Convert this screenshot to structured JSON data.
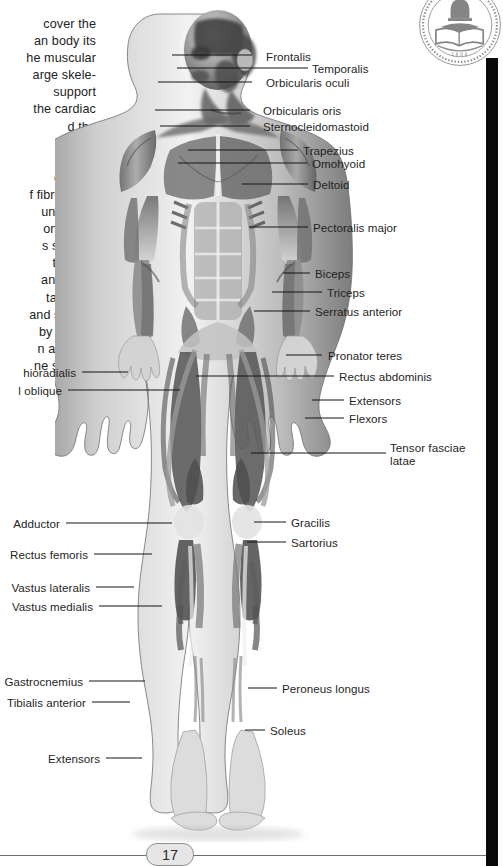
{
  "page": {
    "number": "17",
    "seal_icon": "book-and-bell-seal-icon",
    "seal_year": "1888"
  },
  "bodycopy": {
    "lines": [
      "cover the",
      "an body its",
      "he muscular",
      "arge skele-",
      " support",
      "the cardiac",
      "d the",
      "n our",
      "eletal",
      "ched to",
      "f fibrous tis-",
      " under our",
      "onding to",
      "s system,",
      "to allow",
      "and facial",
      "tary con-",
      "and smooth",
      "by signals",
      "n and hor-",
      "ne system."
    ]
  },
  "illustration": {
    "name": "anterior-view-human-muscular-system",
    "alt": "Front view of the human body showing superficial skeletal muscles"
  },
  "labels_right": [
    {
      "id": "frontalis",
      "text": "Frontalis",
      "x": 266,
      "y": 50,
      "lx1": 252,
      "ly1": 55,
      "lx2": 172,
      "ly2": 55
    },
    {
      "id": "temporalis",
      "text": "Temporalis",
      "x": 312,
      "y": 62,
      "lx1": 308,
      "ly1": 68,
      "lx2": 177,
      "ly2": 68
    },
    {
      "id": "orbicularis-oculi",
      "text": "Orbicularis oculi",
      "x": 266,
      "y": 76,
      "lx1": 252,
      "ly1": 82,
      "lx2": 158,
      "ly2": 82
    },
    {
      "id": "orbicularis-oris",
      "text": "Orbicularis oris",
      "x": 263,
      "y": 104,
      "lx1": 250,
      "ly1": 110,
      "lx2": 155,
      "ly2": 110
    },
    {
      "id": "sternocleidomastoid",
      "text": "Sternocleidomastoid",
      "x": 263,
      "y": 120,
      "lx1": 250,
      "ly1": 126,
      "lx2": 160,
      "ly2": 126
    },
    {
      "id": "trapezius",
      "text": "Trapezius",
      "x": 303,
      "y": 144,
      "lx1": 298,
      "ly1": 150,
      "lx2": 188,
      "ly2": 150
    },
    {
      "id": "omohyoid",
      "text": "Omohyoid",
      "x": 312,
      "y": 157,
      "lx1": 307,
      "ly1": 163,
      "lx2": 178,
      "ly2": 163
    },
    {
      "id": "deltoid",
      "text": "Deltoid",
      "x": 313,
      "y": 178,
      "lx1": 308,
      "ly1": 184,
      "lx2": 242,
      "ly2": 184
    },
    {
      "id": "pectoralis-major",
      "text": "Pectoralis major",
      "x": 313,
      "y": 221,
      "lx1": 308,
      "ly1": 227,
      "lx2": 249,
      "ly2": 227
    },
    {
      "id": "biceps",
      "text": "Biceps",
      "x": 315,
      "y": 267,
      "lx1": 310,
      "ly1": 273,
      "lx2": 283,
      "ly2": 273
    },
    {
      "id": "triceps",
      "text": "Triceps",
      "x": 327,
      "y": 286,
      "lx1": 322,
      "ly1": 292,
      "lx2": 272,
      "ly2": 292
    },
    {
      "id": "serratus-anterior",
      "text": "Serratus anterior",
      "x": 315,
      "y": 305,
      "lx1": 310,
      "ly1": 311,
      "lx2": 254,
      "ly2": 311
    },
    {
      "id": "pronator-teres",
      "text": "Pronator teres",
      "x": 328,
      "y": 349,
      "lx1": 322,
      "ly1": 355,
      "lx2": 286,
      "ly2": 355
    },
    {
      "id": "rectus-abdominis",
      "text": "Rectus abdominis",
      "x": 339,
      "y": 370,
      "lx1": 334,
      "ly1": 376,
      "lx2": 196,
      "ly2": 376
    },
    {
      "id": "extensors-arm",
      "text": "Extensors",
      "x": 349,
      "y": 394,
      "lx1": 344,
      "ly1": 400,
      "lx2": 312,
      "ly2": 400
    },
    {
      "id": "flexors-arm",
      "text": "Flexors",
      "x": 349,
      "y": 412,
      "lx1": 344,
      "ly1": 418,
      "lx2": 305,
      "ly2": 418
    },
    {
      "id": "tensor-fasciae-latae",
      "text": "Tensor\nfasciae latae",
      "x": 390,
      "y": 441,
      "lx1": 386,
      "ly1": 453,
      "lx2": 251,
      "ly2": 453
    },
    {
      "id": "gracilis",
      "text": "Gracilis",
      "x": 291,
      "y": 516,
      "lx1": 286,
      "ly1": 522,
      "lx2": 254,
      "ly2": 522
    },
    {
      "id": "sartorius",
      "text": "Sartorius",
      "x": 291,
      "y": 536,
      "lx1": 286,
      "ly1": 542,
      "lx2": 247,
      "ly2": 542
    },
    {
      "id": "peroneus-longus",
      "text": "Peroneus longus",
      "x": 282,
      "y": 682,
      "lx1": 277,
      "ly1": 688,
      "lx2": 248,
      "ly2": 688
    },
    {
      "id": "soleus",
      "text": "Soleus",
      "x": 270,
      "y": 724,
      "lx1": 265,
      "ly1": 730,
      "lx2": 245,
      "ly2": 730
    }
  ],
  "labels_left": [
    {
      "id": "brachioradialis",
      "text": "hioradialis",
      "x": 0,
      "y": 366,
      "lx1": 82,
      "ly1": 372,
      "lx2": 128,
      "ly2": 372,
      "w": 76
    },
    {
      "id": "external-oblique",
      "text": "l oblique",
      "x": 0,
      "y": 384,
      "lx1": 68,
      "ly1": 390,
      "lx2": 180,
      "ly2": 390,
      "w": 62
    },
    {
      "id": "adductor",
      "text": "Adductor",
      "x": 0,
      "y": 517,
      "lx1": 66,
      "ly1": 523,
      "lx2": 172,
      "ly2": 523,
      "w": 60
    },
    {
      "id": "rectus-femoris",
      "text": "Rectus femoris",
      "x": 0,
      "y": 548,
      "lx1": 94,
      "ly1": 554,
      "lx2": 152,
      "ly2": 554,
      "w": 88
    },
    {
      "id": "vastus-lateralis",
      "text": "Vastus lateralis",
      "x": 0,
      "y": 581,
      "lx1": 96,
      "ly1": 587,
      "lx2": 134,
      "ly2": 587,
      "w": 90
    },
    {
      "id": "vastus-medialis",
      "text": "Vastus medialis",
      "x": 0,
      "y": 600,
      "lx1": 99,
      "ly1": 606,
      "lx2": 162,
      "ly2": 606,
      "w": 93
    },
    {
      "id": "gastrocnemius",
      "text": "Gastrocnemius",
      "x": 0,
      "y": 675,
      "lx1": 89,
      "ly1": 681,
      "lx2": 145,
      "ly2": 681,
      "w": 83
    },
    {
      "id": "tibialis-anterior",
      "text": "Tibialis anterior",
      "x": 0,
      "y": 696,
      "lx1": 92,
      "ly1": 702,
      "lx2": 130,
      "ly2": 702,
      "w": 86
    },
    {
      "id": "extensors-foot",
      "text": "Extensors",
      "x": 0,
      "y": 752,
      "lx1": 106,
      "ly1": 758,
      "lx2": 142,
      "ly2": 758,
      "w": 64
    }
  ],
  "colors": {
    "ink": "#1f1f1f",
    "leader": "#141414",
    "edge_bar": "#0a0a0a",
    "badge_fill": "#e6e6e6",
    "badge_stroke": "#8e8e8e",
    "rule": "#6f6f6f"
  }
}
